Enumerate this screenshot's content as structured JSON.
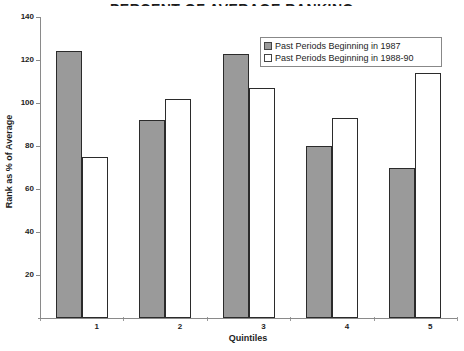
{
  "chart_data": {
    "type": "bar",
    "title": "PERCENT OF AVERAGE RANKING",
    "xlabel": "Quintiles",
    "ylabel": "Rank as % of Average",
    "categories": [
      "1",
      "2",
      "3",
      "4",
      "5"
    ],
    "series": [
      {
        "name": "Past Periods Beginning in 1987",
        "color": "#9a9a9a",
        "values": [
          124,
          92,
          123,
          80,
          70
        ]
      },
      {
        "name": "Past Periods Beginning in 1988-90",
        "color": "#ffffff",
        "values": [
          75,
          102,
          107,
          93,
          114
        ]
      }
    ],
    "ylim": [
      0,
      140
    ],
    "yticks": [
      20,
      40,
      60,
      80,
      100,
      120,
      140
    ],
    "grid": false,
    "legend_position": "top-right",
    "bar_border_color": "#2b2b2b",
    "axis_color": "#8a8a8a"
  }
}
